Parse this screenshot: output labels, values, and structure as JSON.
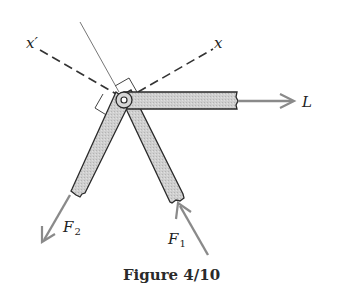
{
  "figure": {
    "caption": "Figure 4/10",
    "axis_labels": {
      "x": "x",
      "x_prime": "x′"
    },
    "forces": [
      {
        "name": "L",
        "label": "L",
        "subscript": ""
      },
      {
        "name": "F1",
        "label": "F",
        "subscript": "1"
      },
      {
        "name": "F2",
        "label": "F",
        "subscript": "2"
      }
    ],
    "colors": {
      "member_fill": "#c8c8c8",
      "member_stroke": "#2a2a2a",
      "force_arrow": "#8a8a8a",
      "dashed_axis": "#333333",
      "background": "#ffffff"
    }
  }
}
